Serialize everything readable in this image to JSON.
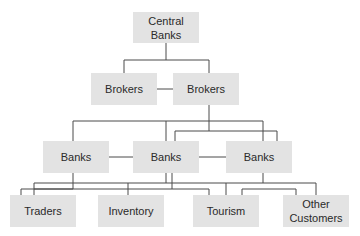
{
  "diagram": {
    "type": "hierarchy",
    "nodes": {
      "central_banks": "Central\nBanks",
      "brokers_left": "Brokers",
      "brokers_right": "Brokers",
      "banks_left": "Banks",
      "banks_middle": "Banks",
      "banks_right": "Banks",
      "traders": "Traders",
      "inventory": "Inventory",
      "tourism": "Tourism",
      "other_customers": "Other\nCustomers"
    },
    "edges": [
      [
        "central_banks",
        "brokers_left"
      ],
      [
        "central_banks",
        "brokers_right"
      ],
      [
        "brokers_left",
        "brokers_right"
      ],
      [
        "brokers_right",
        "banks_left"
      ],
      [
        "brokers_right",
        "banks_middle"
      ],
      [
        "brokers_right",
        "banks_right"
      ],
      [
        "banks_left",
        "banks_middle"
      ],
      [
        "banks_middle",
        "banks_right"
      ],
      [
        "banks_left",
        "traders"
      ],
      [
        "banks_left",
        "inventory"
      ],
      [
        "banks_middle",
        "traders"
      ],
      [
        "banks_middle",
        "inventory"
      ],
      [
        "banks_middle",
        "tourism"
      ],
      [
        "banks_middle",
        "other_customers"
      ],
      [
        "banks_right",
        "tourism"
      ],
      [
        "banks_right",
        "other_customers"
      ]
    ]
  }
}
